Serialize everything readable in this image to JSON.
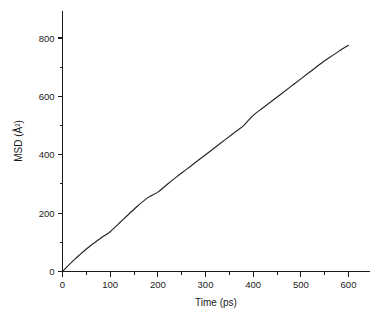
{
  "chart_data": {
    "type": "line",
    "title": "",
    "xlabel": "Time (ps)",
    "ylabel": "MSD (Å²)",
    "xlim": [
      0,
      600
    ],
    "ylim": [
      0,
      870
    ],
    "grid": false,
    "legend": null,
    "x_ticks": [
      0,
      100,
      200,
      300,
      400,
      500,
      600
    ],
    "x_tick_labels": [
      "0",
      "100",
      "200",
      "300",
      "400",
      "500",
      "600"
    ],
    "x_minor_step": 50,
    "y_ticks": [
      0,
      200,
      400,
      600,
      800
    ],
    "y_tick_labels": [
      "0",
      "200",
      "400",
      "600",
      "800"
    ],
    "y_minor_step": 100,
    "series": [
      {
        "name": "MSD",
        "color": "#232323",
        "x": [
          0,
          10,
          20,
          30,
          40,
          50,
          60,
          70,
          80,
          90,
          100,
          120,
          140,
          160,
          180,
          200,
          220,
          240,
          260,
          280,
          300,
          320,
          340,
          360,
          380,
          400,
          420,
          440,
          460,
          480,
          500,
          520,
          540,
          560,
          580,
          600
        ],
        "y": [
          0,
          17,
          33,
          48,
          63,
          77,
          90,
          102,
          114,
          125,
          136,
          167,
          198,
          228,
          254,
          272,
          299,
          325,
          350,
          375,
          400,
          425,
          450,
          475,
          500,
          535,
          560,
          585,
          610,
          635,
          660,
          685,
          710,
          733,
          755,
          775
        ]
      }
    ]
  },
  "axis_titles": {
    "x": "Time (ps)",
    "y": "MSD (Å²)"
  }
}
